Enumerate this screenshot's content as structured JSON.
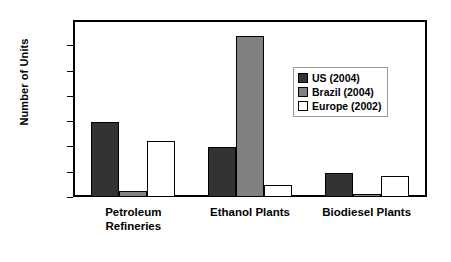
{
  "chart_data": {
    "type": "bar",
    "title": "",
    "xlabel": "",
    "ylabel": "Number of Units",
    "ylim": [
      0,
      350
    ],
    "yticks": [
      0,
      50,
      100,
      150,
      200,
      250,
      300,
      350
    ],
    "grid": false,
    "legend_position": "inside-upper-right",
    "categories": [
      "Petroleum Refineries",
      "Ethanol Plants",
      "Biodiesel Plants"
    ],
    "series": [
      {
        "name": "US  (2004)",
        "values": [
          150,
          100,
          48
        ],
        "color": "#333333"
      },
      {
        "name": "Brazil (2004)",
        "values": [
          13,
          322,
          6
        ],
        "color": "#808080"
      },
      {
        "name": "Europe (2002)",
        "values": [
          112,
          25,
          42
        ],
        "color": "#FFFFFF"
      }
    ]
  },
  "axis": {
    "y_title": "Number of Units",
    "y_ticks": [
      "350",
      "300",
      "250",
      "200",
      "150",
      "100",
      "50",
      "0"
    ]
  },
  "x_categories": [
    {
      "line1": "Petroleum",
      "line2": "Refineries"
    },
    {
      "line1": "Ethanol Plants",
      "line2": ""
    },
    {
      "line1": "Biodiesel Plants",
      "line2": ""
    }
  ],
  "legend": {
    "entries": [
      {
        "label": "US  (2004)"
      },
      {
        "label": "Brazil (2004)"
      },
      {
        "label": "Europe (2002)"
      }
    ]
  }
}
